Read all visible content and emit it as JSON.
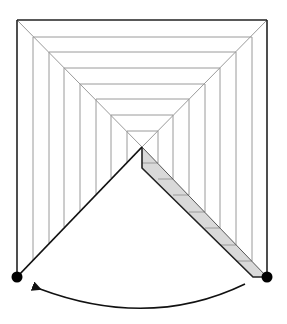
{
  "diagram": {
    "outer_square": {
      "x1": 17,
      "y1": 20,
      "x2": 267,
      "y2": 277
    },
    "nested_levels": 8,
    "apex": {
      "x": 142,
      "y": 147
    },
    "pivot_left": {
      "x": 17,
      "y": 277
    },
    "pivot_right": {
      "x": 267,
      "y": 277
    },
    "strip_segments": 8,
    "arrow": {
      "from": "pivot_right",
      "to": "pivot_left",
      "direction": "counter-clockwise"
    },
    "colors": {
      "outline": "#222222",
      "inner_lines": "#9a9a9a",
      "strip_fill": "#d9d9d9",
      "dot": "#000000",
      "background": "#ffffff"
    }
  }
}
